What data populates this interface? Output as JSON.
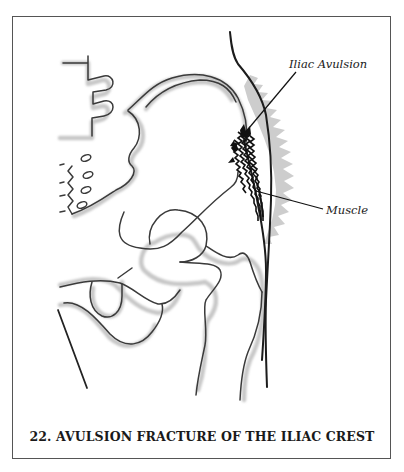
{
  "figure": {
    "number": "22",
    "caption": "22. AVULSION FRACTURE OF THE ILIAC CREST",
    "labels": {
      "iliac_avulsion": "Iliac Avulsion",
      "muscle": "Muscle"
    },
    "colors": {
      "line": "#333333",
      "shadow": "#bdbdbd",
      "muscle_dark": "#111111",
      "halo": "#b8b8b8",
      "frame": "#555555"
    }
  }
}
